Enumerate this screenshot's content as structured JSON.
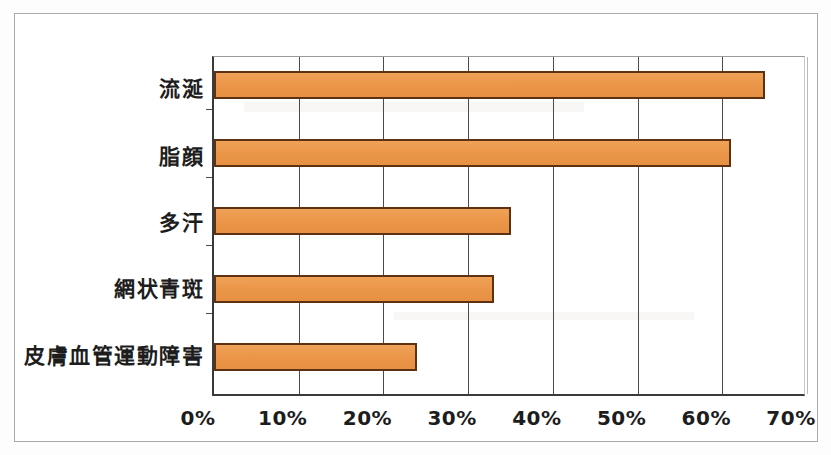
{
  "chart_data": {
    "type": "bar",
    "orientation": "horizontal",
    "title": "",
    "subtitle": "",
    "xlabel": "",
    "ylabel": "",
    "categories": [
      "流涎",
      "脂顔",
      "多汗",
      "網状青斑",
      "皮膚血管運動障害"
    ],
    "values": [
      65,
      61,
      35,
      33,
      24
    ],
    "value_unit": "%",
    "xlim": [
      0,
      70
    ],
    "xticks": [
      0,
      10,
      20,
      30,
      40,
      50,
      60,
      70
    ],
    "xtick_labels": [
      "0%",
      "10%",
      "20%",
      "30%",
      "40%",
      "50%",
      "60%",
      "70%"
    ],
    "grid": true,
    "grid_axis": "x",
    "legend": "none",
    "bar_fill_color": "#ec9a4e",
    "bar_border_color": "#5e3112",
    "axis_color": "#3a3a3a",
    "background_color": "#ffffff",
    "frame_color": "#a9a9ad"
  }
}
